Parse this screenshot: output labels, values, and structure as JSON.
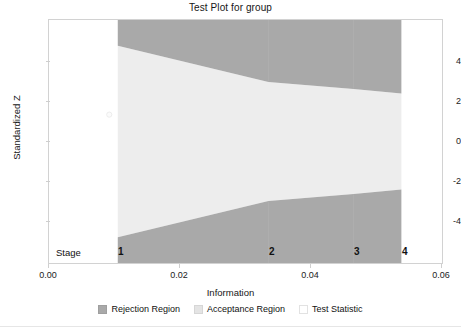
{
  "chart_data": {
    "type": "area",
    "title": "Test Plot for group",
    "xlabel": "Information",
    "ylabel": "Standardized Z",
    "xlim": [
      0.0,
      0.06
    ],
    "ylim": [
      -5.2,
      5.2
    ],
    "xticks": [
      "0.00",
      "0.02",
      "0.04",
      "0.06"
    ],
    "xtick_values": [
      0.0,
      0.02,
      0.04,
      0.06
    ],
    "yticks": [
      "4",
      "2",
      "0",
      "-2",
      "-4"
    ],
    "ytick_values": [
      4,
      2,
      0,
      -2,
      -4
    ],
    "grid": false,
    "legend_position": "bottom",
    "stage_axis_label": "Stage",
    "stages": [
      {
        "label": "1",
        "information": 0.0105,
        "upper_bound": 4.1,
        "lower_bound": -4.1
      },
      {
        "label": "2",
        "information": 0.0335,
        "upper_bound": 2.55,
        "lower_bound": -2.55
      },
      {
        "label": "3",
        "information": 0.0465,
        "upper_bound": 2.25,
        "lower_bound": -2.25
      },
      {
        "label": "4",
        "information": 0.0538,
        "upper_bound": 2.05,
        "lower_bound": -2.05
      }
    ],
    "series": [
      {
        "name": "Rejection Region",
        "color": "#a9a9a9",
        "type": "area",
        "upper_band": {
          "from": "boundary",
          "to": 5.2
        },
        "lower_band": {
          "from": -5.2,
          "to": "boundary"
        }
      },
      {
        "name": "Acceptance Region",
        "color": "#ededed",
        "type": "area",
        "description": "Vertical band at final stage between lower and upper boundary"
      },
      {
        "name": "Test Statistic",
        "color": "#fbfbfb",
        "type": "scatter",
        "points": [
          {
            "information": 0.0092,
            "z": 1.15
          }
        ]
      }
    ]
  },
  "legend": {
    "items": [
      {
        "label": "Rejection Region",
        "color": "#a9a9a9",
        "swatch": "filled-square"
      },
      {
        "label": "Acceptance Region",
        "color": "#e4e4e4",
        "swatch": "filled-square"
      },
      {
        "label": "Test Statistic",
        "color": "#ffffff",
        "swatch": "open-square"
      }
    ]
  },
  "colors": {
    "rejection": "#a9a9a9",
    "acceptance": "#ededed",
    "frame": "#d2d2d2",
    "gridline": "#b9b9b9",
    "background": "#ffffff",
    "text": "#161616"
  }
}
